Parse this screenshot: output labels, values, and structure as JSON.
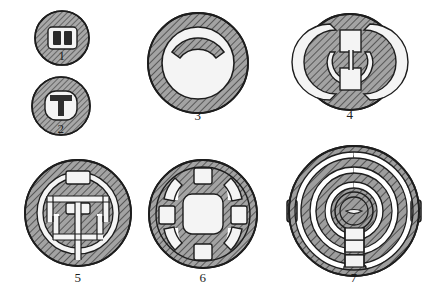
{
  "plate": {
    "kind": "archaeological-illustration-plate",
    "description": "Line-drawing plate of seven hatched circular artefact cross-sections, numbered 1-7",
    "background_color": "#ffffff",
    "ink_color": "#1d1d1d",
    "fill_color": "#9d9d9d",
    "hatch_color": "#3a3a3a",
    "void_color": "#f2f2f2",
    "figures": [
      {
        "id": "figure-1",
        "label": "1",
        "shape": "small disc with rounded-rectangle void containing two dark vertical bars",
        "cx": 62,
        "cy": 38,
        "r": 27,
        "label_x": 62,
        "label_y": 57
      },
      {
        "id": "figure-2",
        "label": "2",
        "shape": "small disc with circular void containing a dark T-shaped (gong) bar",
        "cx": 61,
        "cy": 106,
        "r": 29,
        "label_x": 61,
        "label_y": 130
      },
      {
        "id": "figure-3",
        "label": "3",
        "shape": "plain annulus ring with a crescent arc band set inside the upper half",
        "cx": 198,
        "cy": 63,
        "r": 50,
        "label_x": 198,
        "label_y": 117
      },
      {
        "id": "figure-4",
        "label": "4",
        "shape": "hatched disc with two stacked square voids flanked by paired crescent voids",
        "cx": 350,
        "cy": 62,
        "r": 48,
        "label_x": 350,
        "label_y": 116
      },
      {
        "id": "figure-5",
        "label": "5",
        "shape": "hatched disc with broken inner ring and cruciform channel voids with three rectangles",
        "cx": 78,
        "cy": 213,
        "r": 53,
        "label_x": 78,
        "label_y": 279
      },
      {
        "id": "figure-6",
        "label": "6",
        "shape": "hatched disc, central rounded-square void, four square voids on axes, four arc slots on diagonals",
        "cx": 203,
        "cy": 214,
        "r": 54,
        "label_x": 203,
        "label_y": 279
      },
      {
        "id": "figure-7",
        "label": "7",
        "shape": "hatched disc of concentric spiral rings joined by radial bridges at the base, lens motif at centre",
        "cx": 354,
        "cy": 211,
        "r": 65,
        "label_x": 354,
        "label_y": 279
      }
    ]
  }
}
